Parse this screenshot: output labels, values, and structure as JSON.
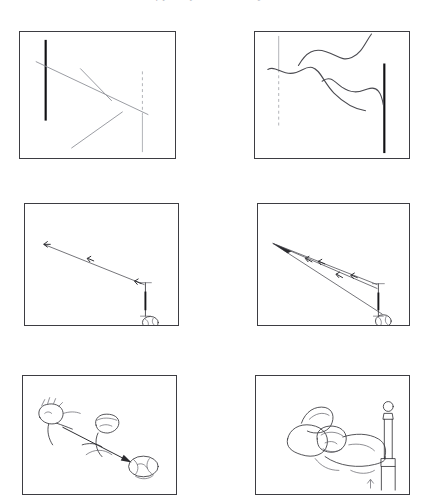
{
  "page": {
    "background_color": "#ffffff",
    "ink_color": "#2b2b2f",
    "faint_ink_color": "#8e9097",
    "width": 429,
    "height": 472,
    "top_caption_clipped": "of perceptual causality"
  },
  "figure": {
    "columns": 2,
    "rows": 3,
    "panel_border_color": "#3d3d42",
    "panel_count": 6
  },
  "panels": [
    {
      "id": "panel-1",
      "position": "top-left",
      "label": "a",
      "description": "Rectangular frame containing a thick black vertical bar at the left, a vertical line that is dashed above and solid below at the right, and three faint straight diagonal strokes.",
      "elements": {
        "thick_vertical_bar": "left",
        "reference_line": "dashed-above-solid-below",
        "stroke_type": "straight",
        "stroke_count": 3
      }
    },
    {
      "id": "panel-2",
      "position": "top-right",
      "label": "b",
      "description": "Mirror of panel 1: a vertical line that is solid above and dashed below at the left, a thick black vertical bar at the right, and three wavy freehand curves descending to the right.",
      "elements": {
        "thick_vertical_bar": "right",
        "reference_line": "solid-above-dashed-below",
        "stroke_type": "wavy",
        "stroke_count": 3
      }
    },
    {
      "id": "panel-3",
      "position": "middle-left",
      "label": "c",
      "description": "Single straight trajectory with arrow ticks running from a bat at the lower right up to the upper left, a small ball resting at the lower right corner.",
      "elements": {
        "trajectory_count": 1,
        "arrow_tick_count": 3,
        "bat": "lower-right",
        "ball": "bottom-right-corner"
      }
    },
    {
      "id": "panel-4",
      "position": "middle-right",
      "label": "d",
      "description": "Three straight trajectories with arrow ticks fanning out from a single convergence point at the upper left back to the bat and ball at the lower right.",
      "elements": {
        "trajectory_count": 3,
        "arrow_tick_count": 6,
        "convergence_point": "upper-left",
        "bat": "lower-right",
        "ball": "bottom-right-corner"
      }
    },
    {
      "id": "panel-5",
      "position": "bottom-left",
      "label": "e",
      "description": "Freehand sketch: a seated figure at the left and a crouching catcher figure at the centre, with a long arrow running from the left figure down to the right toward a ball.",
      "elements": {
        "figure_count": 2,
        "arrow": "left-to-lower-right",
        "ball": "lower-right"
      }
    },
    {
      "id": "panel-6",
      "position": "bottom-right",
      "label": "f",
      "description": "Freehand sketch of a person lying asleep on a bed, head on a pillow, with a turned bedpost and ball finial rising at the right.",
      "elements": {
        "figure_count": 1,
        "bedpost": "right",
        "finial": "ball"
      }
    }
  ]
}
